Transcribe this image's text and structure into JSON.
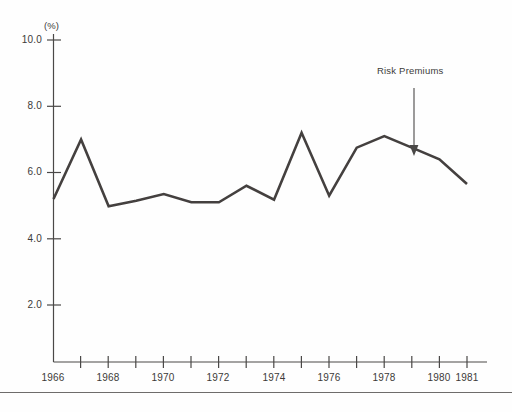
{
  "chart_data": {
    "type": "line",
    "title": "",
    "subtitle": "",
    "xlabel": "",
    "ylabel": "(%)",
    "unit_label": "(%)",
    "x": [
      1966,
      1967,
      1968,
      1969,
      1970,
      1971,
      1972,
      1973,
      1974,
      1975,
      1976,
      1977,
      1978,
      1979,
      1980,
      1981
    ],
    "series": [
      {
        "name": "Risk Premiums",
        "color": "#44403f",
        "values": [
          5.2,
          7.0,
          4.98,
          5.15,
          5.35,
          5.1,
          5.1,
          5.6,
          5.18,
          7.2,
          5.3,
          6.75,
          7.1,
          6.75,
          6.4,
          5.65
        ]
      }
    ],
    "categories": [
      "1966",
      "1967",
      "1968",
      "1969",
      "1970",
      "1971",
      "1972",
      "1973",
      "1974",
      "1975",
      "1976",
      "1977",
      "1978",
      "1979",
      "1980",
      "1981"
    ],
    "xtick_labels": [
      "1966",
      "1968",
      "1970",
      "1972",
      "1974",
      "1976",
      "1978",
      "1980",
      "1981"
    ],
    "xtick_years": [
      1966,
      1968,
      1970,
      1972,
      1974,
      1976,
      1978,
      1980,
      1981
    ],
    "ytick_labels": [
      "10.0",
      "8.0",
      "6.0",
      "4.0",
      "2.0"
    ],
    "ytick_values": [
      10.0,
      8.0,
      6.0,
      4.0,
      2.0
    ],
    "ylim": [
      0.0,
      10.6
    ],
    "xlim": [
      1966,
      1981
    ],
    "grid": false,
    "legend": "none",
    "annotations": [
      {
        "text": "Risk Premiums",
        "target_x": 1979,
        "target_y": 6.75,
        "arrow": "down-arrow"
      }
    ]
  },
  "axes": {
    "y_unit": "(%)",
    "ticks_y": [
      "10.0",
      "8.0",
      "6.0",
      "4.0",
      "2.0"
    ],
    "ticks_x": [
      "1966",
      "1968",
      "1970",
      "1972",
      "1974",
      "1976",
      "1978",
      "1980",
      "1981"
    ]
  },
  "annotation": {
    "label": "Risk Premiums"
  },
  "colors": {
    "line": "#44403f",
    "axis": "#4a4847",
    "text": "#3c3a39",
    "background": "#fefefe",
    "rule": "#6e6c6b"
  }
}
